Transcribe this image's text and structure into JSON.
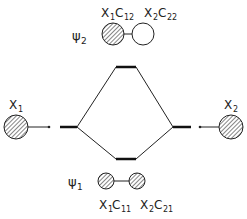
{
  "diagram": {
    "type": "molecular-orbital-energy-level",
    "atomic_orbitals": [
      {
        "label": "X",
        "sub": "1"
      },
      {
        "label": "X",
        "sub": "2"
      }
    ],
    "molecular_orbitals": [
      {
        "symbol": "ψ",
        "sub": "2",
        "coef1": {
          "x": "X",
          "xs": "1",
          "c": "C",
          "cs": "12"
        },
        "coef2": {
          "x": "X",
          "xs": "2",
          "c": "C",
          "cs": "22"
        },
        "phase": "opposite"
      },
      {
        "symbol": "ψ",
        "sub": "1",
        "coef1": {
          "x": "X",
          "xs": "1",
          "c": "C",
          "cs": "11"
        },
        "coef2": {
          "x": "X",
          "xs": "2",
          "c": "C",
          "cs": "21"
        },
        "phase": "same"
      }
    ],
    "colors": {
      "line": "#1a1a1a",
      "hatch": "#333333"
    }
  }
}
